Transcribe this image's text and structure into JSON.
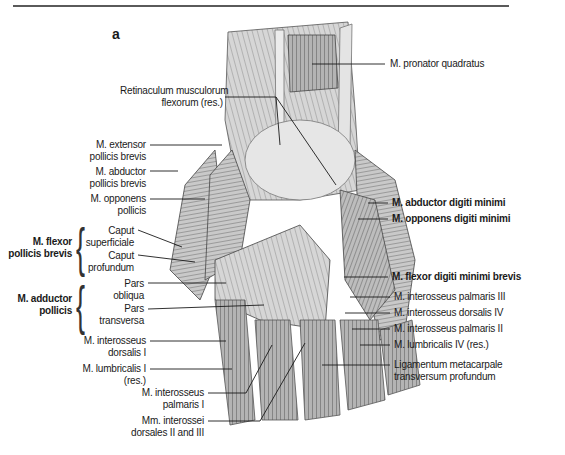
{
  "figure": {
    "panel_letter": "a",
    "accent_colors": {
      "rule": "#5a5a5a",
      "leader_line": "#1a1a1a",
      "muscle_tone": "#8c8c8c"
    }
  },
  "labels": {
    "pronator_quadratus": "M. pronator quadratus",
    "retinaculum_line1": "Retinaculum musculorum",
    "retinaculum_line2": "flexorum (res.)",
    "extensor_pollicis_brevis_line1": "M. extensor",
    "extensor_pollicis_brevis_line2": "pollicis brevis",
    "abductor_pollicis_brevis_line1": "M. abductor",
    "abductor_pollicis_brevis_line2": "pollicis brevis",
    "opponens_pollicis_line1": "M. opponens",
    "opponens_pollicis_line2": "pollicis",
    "flexor_pollicis_brevis_group_line1": "M. flexor",
    "flexor_pollicis_brevis_group_line2": "pollicis brevis",
    "caput_superficiale_line1": "Caput",
    "caput_superficiale_line2": "superficiale",
    "caput_profundum_line1": "Caput",
    "caput_profundum_line2": "profundum",
    "adductor_pollicis_group_line1": "M. adductor",
    "adductor_pollicis_group_line2": "pollicis",
    "pars_obliqua_line1": "Pars",
    "pars_obliqua_line2": "obliqua",
    "pars_transversa_line1": "Pars",
    "pars_transversa_line2": "transversa",
    "interosseus_dorsalis_1_line1": "M. interosseus",
    "interosseus_dorsalis_1_line2": "dorsalis I",
    "lumbricalis_1_line1": "M. lumbricalis I",
    "lumbricalis_1_line2": "(res.)",
    "interosseus_palmaris_1_line1": "M. interosseus",
    "interosseus_palmaris_1_line2": "palmaris I",
    "interossei_dorsales_2_3_line1": "Mm. interossei",
    "interossei_dorsales_2_3_line2": "dorsales II and III",
    "abductor_digiti_minimi": "M. abductor digiti minimi",
    "opponens_digiti_minimi": "M. opponens digiti minimi",
    "flexor_digiti_minimi_brevis": "M. flexor digiti minimi brevis",
    "interosseus_palmaris_3": "M. interosseus palmaris III",
    "interosseus_dorsalis_4": "M. interosseus dorsalis IV",
    "interosseus_palmaris_2": "M. interosseus palmaris II",
    "lumbricalis_4": "M. lumbricalis IV (res.)",
    "ligamentum_line1": "Ligamentum metacarpale",
    "ligamentum_line2": "transversum profundum"
  }
}
